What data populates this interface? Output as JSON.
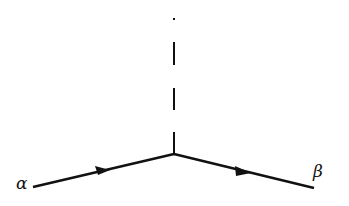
{
  "diagram": {
    "type": "feynman-vertex",
    "colors": {
      "line": "#111111",
      "background": "#ffffff"
    },
    "vertex": {
      "x": 174,
      "y": 154
    },
    "incoming_line": {
      "label": "α",
      "from": {
        "x": 33,
        "y": 187
      },
      "to": {
        "x": 174,
        "y": 154
      },
      "arrow_direction": "toward-vertex"
    },
    "outgoing_line": {
      "label": "β",
      "from": {
        "x": 174,
        "y": 154
      },
      "to": {
        "x": 314,
        "y": 188
      },
      "arrow_direction": "away-from-vertex"
    },
    "dashed_line": {
      "style": "dashed",
      "from": {
        "x": 174,
        "y": 19
      },
      "to": {
        "x": 174,
        "y": 154
      }
    }
  }
}
